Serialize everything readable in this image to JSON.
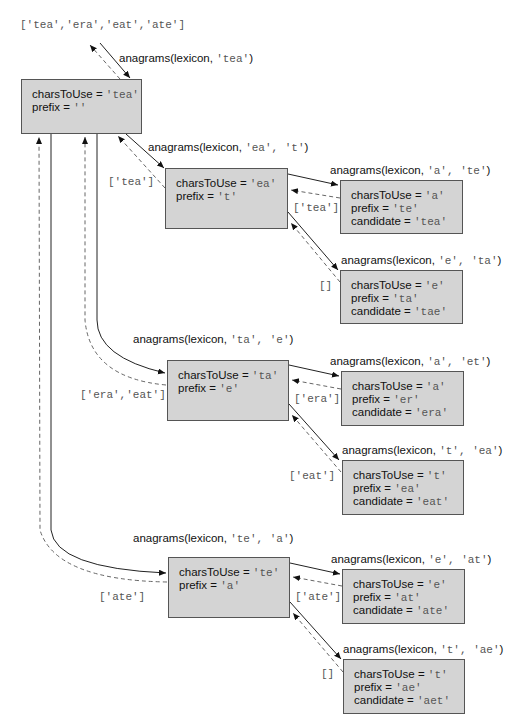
{
  "result": "['tea','era','eat','ate']",
  "root": {
    "call": {
      "fn": "anagrams(lexicon, ",
      "args": "'tea'",
      "close": ")"
    },
    "chars_label": "charsToUse = ",
    "chars": "'tea'",
    "prefix_label": "prefix = ",
    "prefix": "''"
  },
  "children": [
    {
      "call": {
        "fn": "anagrams(lexicon, ",
        "args": "'ea', 't'",
        "close": ")"
      },
      "chars_label": "charsToUse = ",
      "chars": "'ea'",
      "prefix_label": "prefix = ",
      "prefix": "'t'",
      "returns": "['tea']",
      "leaves": [
        {
          "call": {
            "fn": "anagrams(lexicon, ",
            "args": "'a', 'te'",
            "close": ")"
          },
          "chars_label": "charsToUse = ",
          "chars": "'a'",
          "prefix_label": "prefix = ",
          "prefix": "'te'",
          "candidate_label": "candidate = ",
          "candidate": "'tea'",
          "returns": "['tea']"
        },
        {
          "call": {
            "fn": "anagrams(lexicon, ",
            "args": "'e', 'ta'",
            "close": ")"
          },
          "chars_label": "charsToUse = ",
          "chars": "'e'",
          "prefix_label": "prefix = ",
          "prefix": "'ta'",
          "candidate_label": "candidate = ",
          "candidate": "'tae'",
          "returns": "[]"
        }
      ]
    },
    {
      "call": {
        "fn": "anagrams(lexicon, ",
        "args": "'ta', 'e'",
        "close": ")"
      },
      "chars_label": "charsToUse = ",
      "chars": "'ta'",
      "prefix_label": "prefix = ",
      "prefix": "'e'",
      "returns": "['era','eat']",
      "leaves": [
        {
          "call": {
            "fn": "anagrams(lexicon, ",
            "args": "'a', 'et'",
            "close": ")"
          },
          "chars_label": "charsToUse = ",
          "chars": "'a'",
          "prefix_label": "prefix = ",
          "prefix": "'er'",
          "candidate_label": "candidate = ",
          "candidate": "'era'",
          "returns": "['era']"
        },
        {
          "call": {
            "fn": "anagrams(lexicon, ",
            "args": "'t', 'ea'",
            "close": ")"
          },
          "chars_label": "charsToUse = ",
          "chars": "'t'",
          "prefix_label": "prefix = ",
          "prefix": "'ea'",
          "candidate_label": "candidate = ",
          "candidate": "'eat'",
          "returns": "['eat']"
        }
      ]
    },
    {
      "call": {
        "fn": "anagrams(lexicon, ",
        "args": "'te', 'a'",
        "close": ")"
      },
      "chars_label": "charsToUse = ",
      "chars": "'te'",
      "prefix_label": "prefix = ",
      "prefix": "'a'",
      "returns": "['ate']",
      "leaves": [
        {
          "call": {
            "fn": "anagrams(lexicon, ",
            "args": "'e', 'at'",
            "close": ")"
          },
          "chars_label": "charsToUse = ",
          "chars": "'e'",
          "prefix_label": "prefix = ",
          "prefix": "'at'",
          "candidate_label": "candidate = ",
          "candidate": "'ate'",
          "returns": "['ate']"
        },
        {
          "call": {
            "fn": "anagrams(lexicon, ",
            "args": "'t', 'ae'",
            "close": ")"
          },
          "chars_label": "charsToUse = ",
          "chars": "'t'",
          "prefix_label": "prefix = ",
          "prefix": "'ae'",
          "candidate_label": "candidate = ",
          "candidate": "'aet'",
          "returns": "[]"
        }
      ]
    }
  ],
  "colors": {
    "box_fill": "#d4d4d4",
    "box_border": "#555555",
    "line": "#222222",
    "dashed": "#666666",
    "mono_text": "#555555"
  }
}
